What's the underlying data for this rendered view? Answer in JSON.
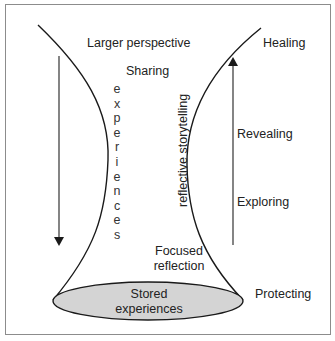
{
  "diagram": {
    "labels": {
      "larger_perspective": "Larger perspective",
      "sharing": "Sharing",
      "experiences_vertical": "experiences",
      "reflective_storytelling": "reflective storytelling",
      "focused_reflection_line1": "Focused",
      "focused_reflection_line2": "reflection",
      "stored_experiences_line1": "Stored",
      "stored_experiences_line2": "experiences",
      "healing": "Healing",
      "revealing": "Revealing",
      "exploring": "Exploring",
      "protecting": "Protecting"
    },
    "colors": {
      "stroke": "#1a1a1a",
      "ellipse_fill": "#d4d4d4",
      "frame": "#8c8c8c",
      "arrow": "#333333"
    },
    "arrows": {
      "down": {
        "x": 59,
        "y1": 56,
        "y2": 245,
        "direction": "down"
      },
      "up": {
        "x": 233,
        "y1": 245,
        "y2": 57,
        "direction": "up"
      }
    }
  }
}
